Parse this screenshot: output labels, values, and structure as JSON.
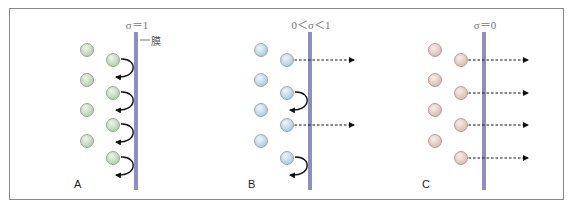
{
  "figure": {
    "membrane_label": "膜",
    "colors": {
      "membrane": "#8e8fc0",
      "frame": "#8a8a8a",
      "arrow": "#111111"
    },
    "panels": [
      {
        "label": "A",
        "sigma": "σ＝1",
        "particle_color": "#c5d8bf",
        "particle_stroke": "#7f9a7a",
        "behavior": [
          "reflect",
          "reflect",
          "reflect",
          "reflect"
        ]
      },
      {
        "label": "B",
        "sigma": "0＜σ＜1",
        "particle_color": "#c3dbe6",
        "particle_stroke": "#7c9aaa",
        "behavior": [
          "pass",
          "reflect",
          "pass",
          "reflect"
        ]
      },
      {
        "label": "C",
        "sigma": "σ＝0",
        "particle_color": "#e8d2cb",
        "particle_stroke": "#a58a82",
        "behavior": [
          "pass",
          "pass",
          "pass",
          "pass"
        ]
      }
    ]
  }
}
